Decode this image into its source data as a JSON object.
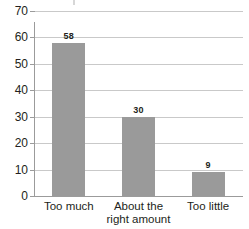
{
  "chart_data": {
    "type": "bar",
    "title": "",
    "subtitle": "",
    "xlabel": "",
    "ylabel": "",
    "categories": [
      "Too much",
      "About the right amount",
      "Too little"
    ],
    "category_lines": [
      [
        "Too much"
      ],
      [
        "About the",
        "right amount"
      ],
      [
        "Too little"
      ]
    ],
    "values": [
      58,
      30,
      9
    ],
    "value_labels": [
      "58",
      "30",
      "9"
    ],
    "ylim": [
      0,
      70
    ],
    "yticks": [
      0,
      10,
      20,
      30,
      40,
      50,
      60,
      70
    ],
    "ytick_labels": [
      "0",
      "10",
      "20",
      "30",
      "40",
      "50",
      "60",
      "70"
    ],
    "grid": true,
    "grid_axis": "y",
    "legend": false,
    "legend_position": "none",
    "colors": {
      "bar": "#9a9a9a",
      "gridline": "#c9c9c9",
      "axis": "#9b9b9b",
      "text": "#231f20",
      "background": "#ffffff"
    }
  }
}
